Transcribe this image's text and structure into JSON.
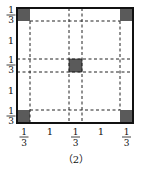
{
  "figure": {
    "caption": "（2）",
    "colors": {
      "border": "#111111",
      "shade": "#5a5a5a",
      "dash": "#222222",
      "background": "#ffffff"
    },
    "left_labels": [
      {
        "num": "1",
        "den": "3"
      },
      {
        "text": "1"
      },
      {
        "num": "1",
        "den": "3"
      },
      {
        "text": "1"
      },
      {
        "num": "1",
        "den": "3"
      }
    ],
    "bottom_labels": [
      {
        "num": "1",
        "den": "3"
      },
      {
        "text": "1"
      },
      {
        "num": "1",
        "den": "3"
      },
      {
        "text": "1"
      },
      {
        "num": "1",
        "den": "3"
      }
    ],
    "segments": [
      "1/3",
      "1",
      "1/3",
      "1",
      "1/3"
    ]
  }
}
